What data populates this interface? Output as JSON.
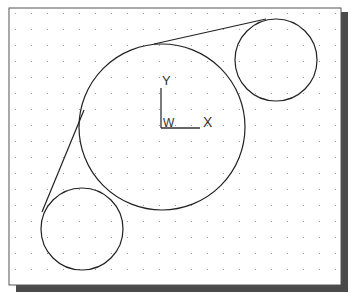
{
  "drawing": {
    "frame": {
      "x": 9,
      "y": 8,
      "width": 332,
      "height": 277,
      "border_color": "#555555",
      "shadow_color": "#4a4a4a",
      "shadow_offset": 7
    },
    "grid": {
      "start_x": 15,
      "start_y": 13,
      "spacing": 16,
      "dot_color": "#9a9a9a"
    },
    "circles": [
      {
        "name": "large-circle",
        "cx": 162,
        "cy": 127,
        "r": 83
      },
      {
        "name": "top-right-circle",
        "cx": 276,
        "cy": 60,
        "r": 41
      },
      {
        "name": "bottom-left-circle",
        "cx": 82,
        "cy": 229,
        "r": 41
      }
    ],
    "tangent_lines": [
      {
        "name": "top-tangent-line",
        "x1": 154,
        "y1": 44,
        "x2": 266,
        "y2": 19
      },
      {
        "name": "left-tangent-line",
        "x1": 42,
        "y1": 212,
        "x2": 84,
        "y2": 110
      }
    ],
    "line_color": "#222222",
    "ucs_icon": {
      "origin_x": 161,
      "origin_y": 128,
      "y_axis_top": 88,
      "x_axis_right": 200,
      "y_label": "Y",
      "x_label": "X",
      "w_label": "W"
    }
  }
}
